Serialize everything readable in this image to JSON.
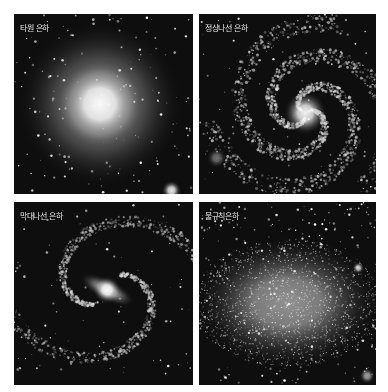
{
  "panels": [
    {
      "id": "p-ell",
      "type": "elliptical",
      "label": "타원 은하"
    },
    {
      "id": "p-spi",
      "type": "spiral",
      "label": "정상나선 은하"
    },
    {
      "id": "p-bar",
      "type": "barred-spiral",
      "label": "막대나선 은하"
    },
    {
      "id": "p-irr",
      "type": "irregular",
      "label": "불규칙은하"
    }
  ]
}
